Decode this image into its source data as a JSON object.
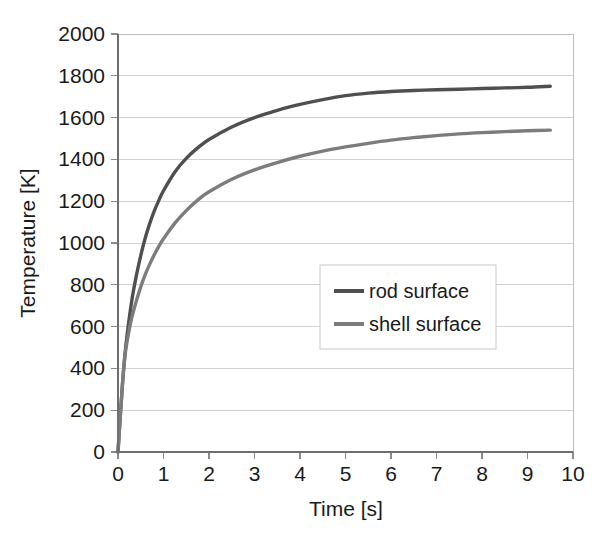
{
  "chart_data": {
    "type": "line",
    "title": "",
    "xlabel": "Time [s]",
    "ylabel": "Temperature [K]",
    "xlim": [
      0,
      10
    ],
    "ylim": [
      0,
      2000
    ],
    "xticks": [
      "0",
      "1",
      "2",
      "3",
      "4",
      "5",
      "6",
      "7",
      "8",
      "9",
      "10"
    ],
    "yticks": [
      "0",
      "200",
      "400",
      "600",
      "800",
      "1000",
      "1200",
      "1400",
      "1600",
      "1800",
      "2000"
    ],
    "grid": "horizontal",
    "legend_position": "center-right",
    "series": [
      {
        "name": "rod surface",
        "color": "#4f4f4f",
        "x": [
          0,
          0.05,
          0.1,
          0.15,
          0.2,
          0.3,
          0.4,
          0.5,
          0.6,
          0.7,
          0.8,
          0.9,
          1.0,
          1.25,
          1.5,
          1.75,
          2.0,
          2.5,
          3.0,
          3.5,
          4.0,
          4.5,
          5.0,
          5.5,
          6.0,
          6.5,
          7.0,
          7.5,
          8.0,
          8.5,
          9.0,
          9.5
        ],
        "y": [
          0,
          170,
          330,
          460,
          560,
          720,
          840,
          940,
          1025,
          1095,
          1155,
          1205,
          1250,
          1340,
          1405,
          1455,
          1495,
          1555,
          1600,
          1635,
          1663,
          1686,
          1705,
          1717,
          1725,
          1730,
          1733,
          1736,
          1739,
          1742,
          1745,
          1750
        ]
      },
      {
        "name": "shell surface",
        "color": "#7c7c7c",
        "x": [
          0,
          0.05,
          0.1,
          0.15,
          0.2,
          0.3,
          0.4,
          0.5,
          0.6,
          0.7,
          0.8,
          0.9,
          1.0,
          1.25,
          1.5,
          1.75,
          2.0,
          2.5,
          3.0,
          3.5,
          4.0,
          4.5,
          5.0,
          5.5,
          6.0,
          6.5,
          7.0,
          7.5,
          8.0,
          8.5,
          9.0,
          9.5
        ],
        "y": [
          0,
          170,
          330,
          455,
          530,
          640,
          720,
          790,
          850,
          900,
          945,
          985,
          1020,
          1095,
          1155,
          1205,
          1245,
          1305,
          1350,
          1385,
          1415,
          1440,
          1460,
          1477,
          1492,
          1504,
          1514,
          1522,
          1528,
          1533,
          1537,
          1540
        ]
      }
    ]
  },
  "legend": {
    "entries": [
      {
        "label": "rod surface",
        "color": "#4f4f4f"
      },
      {
        "label": "shell surface",
        "color": "#7c7c7c"
      }
    ]
  },
  "axes": {
    "x_title": "Time [s]",
    "y_title": "Temperature [K]"
  }
}
